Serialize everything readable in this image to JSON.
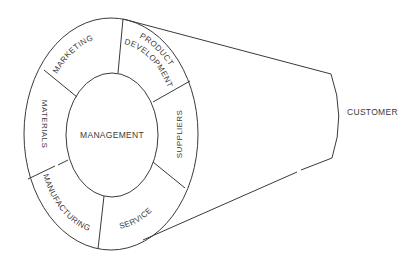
{
  "diagram": {
    "center_label": "MANAGEMENT",
    "ring_segments": [
      {
        "id": "marketing",
        "label": "MARKETING"
      },
      {
        "id": "product-development",
        "label_line1": "PRODUCT",
        "label_line2": "DEVELOPMENT"
      },
      {
        "id": "suppliers",
        "label": "SUPPLIERS"
      },
      {
        "id": "service",
        "label": "SERVICE"
      },
      {
        "id": "manufacturing",
        "label": "MANUFACTURING"
      },
      {
        "id": "materials",
        "label": "MATERIALS"
      }
    ],
    "cone_target_label": "CUSTOMER",
    "colors": {
      "line": "#3a3a3a",
      "background": "#ffffff"
    }
  }
}
